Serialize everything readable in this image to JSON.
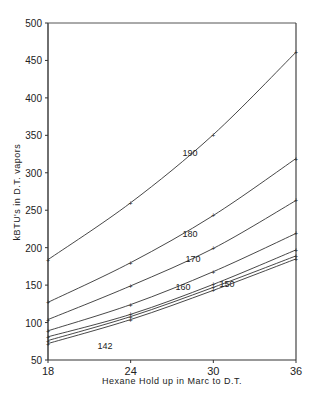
{
  "chart_data": {
    "type": "line",
    "title": "",
    "xlabel": "Hexane Hold up in Marc to D.T.",
    "ylabel": "kBTU's in D.T. vapors",
    "xlim": [
      18,
      36
    ],
    "ylim": [
      50,
      500
    ],
    "x_ticks": [
      18,
      24,
      30,
      36
    ],
    "y_ticks": [
      50,
      100,
      150,
      200,
      250,
      300,
      350,
      400,
      450,
      500
    ],
    "grid": false,
    "legend": "inline curve labels",
    "x": [
      18,
      24,
      30,
      36
    ],
    "series": [
      {
        "name": "190",
        "values": [
          184,
          260,
          351,
          461
        ]
      },
      {
        "name": "180",
        "values": [
          127,
          180,
          243,
          319
        ]
      },
      {
        "name": "170",
        "values": [
          104,
          149,
          199,
          263
        ]
      },
      {
        "name": "160",
        "values": [
          89,
          124,
          168,
          219
        ]
      },
      {
        "name": "150",
        "values": [
          81,
          111,
          151,
          197
        ]
      },
      {
        "name": "142",
        "values": [
          76,
          108,
          147,
          189
        ]
      },
      {
        "name": "142 (lower)",
        "values": [
          72,
          104,
          143,
          185
        ]
      }
    ],
    "annotations": [
      {
        "text": "190",
        "x": 30,
        "y": 365
      },
      {
        "text": "180",
        "x": 30,
        "y": 250
      },
      {
        "text": "170",
        "x": 30,
        "y": 205
      },
      {
        "text": "160",
        "x": 30,
        "y": 170
      },
      {
        "text": "150",
        "x": 30,
        "y": 170
      },
      {
        "text": "142",
        "x": 24,
        "y": 100
      }
    ]
  },
  "labels": {
    "xlabel": "Hexane Hold up in Marc to D.T.",
    "ylabel": "kBTU's in D.T. vapors"
  }
}
